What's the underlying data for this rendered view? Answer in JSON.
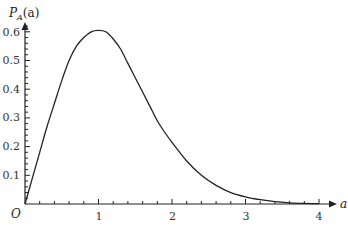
{
  "chart_data": {
    "type": "line",
    "title": "",
    "xlabel": "a",
    "ylabel": "P_A(a)",
    "origin_label": "O",
    "xlim": [
      0,
      4.15
    ],
    "ylim": [
      0,
      0.63
    ],
    "x_ticks": [
      1,
      2,
      3,
      4
    ],
    "x_tick_labels": [
      "1",
      "2",
      "3",
      "4"
    ],
    "y_ticks": [
      0.1,
      0.2,
      0.3,
      0.4,
      0.5,
      0.6
    ],
    "y_tick_labels": [
      "0.1",
      "0.2",
      "0.3",
      "0.4",
      "0.5",
      "0.6"
    ],
    "grid": false,
    "legend": null,
    "series": [
      {
        "name": "P_A(a)",
        "x": [
          0,
          0.1,
          0.2,
          0.3,
          0.4,
          0.5,
          0.6,
          0.7,
          0.8,
          0.9,
          1.0,
          1.1,
          1.2,
          1.3,
          1.4,
          1.5,
          1.6,
          1.7,
          1.8,
          1.9,
          2.0,
          2.2,
          2.4,
          2.6,
          2.8,
          3.0,
          3.2,
          3.4,
          3.6,
          3.8,
          4.0
        ],
        "values": [
          0,
          0.09,
          0.18,
          0.27,
          0.35,
          0.43,
          0.5,
          0.55,
          0.58,
          0.6,
          0.605,
          0.6,
          0.575,
          0.54,
          0.49,
          0.44,
          0.39,
          0.34,
          0.29,
          0.25,
          0.215,
          0.15,
          0.1,
          0.065,
          0.04,
          0.025,
          0.015,
          0.008,
          0.004,
          0.002,
          0.001
        ]
      }
    ]
  },
  "labels": {
    "ylabel_main": "P",
    "ylabel_sub": "A",
    "ylabel_arg": "(a)",
    "xlabel": "a",
    "origin": "O",
    "x1": "1",
    "x2": "2",
    "x3": "3",
    "x4": "4",
    "y1": "0.1",
    "y2": "0.2",
    "y3": "0.3",
    "y4": "0.4",
    "y5": "0.5",
    "y6": "0.6"
  }
}
